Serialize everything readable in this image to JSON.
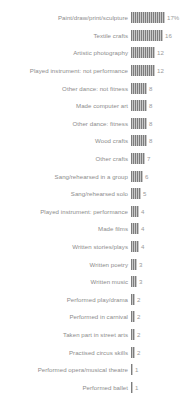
{
  "chart": {
    "title": "",
    "subtitle": "",
    "xlabel": "",
    "ylabel": "",
    "bar_color": "#7d7d7d",
    "bar_fill_color": "#c9c9c9",
    "label_color": "#8c8c8c",
    "value_color": "#9a9a9a",
    "background_color": "#ffffff"
  },
  "chart_data": {
    "type": "bar",
    "orientation": "horizontal",
    "title": "",
    "xlabel": "",
    "ylabel": "",
    "xlim": [
      0,
      17
    ],
    "grid": false,
    "legend": null,
    "units": "percent",
    "categories": [
      "Paint/draw/print/sculpture",
      "Textile crafts",
      "Artistic photography",
      "Played instrument: not performance",
      "Other dance: not fitness",
      "Made computer art",
      "Other dance: fitness",
      "Wood crafts",
      "Other crafts",
      "Sang/rehearsed in a group",
      "Sang/rehearsed solo",
      "Played instrument: performance",
      "Made films",
      "Written stories/plays",
      "Written poetry",
      "Written music",
      "Performed play/drama",
      "Performed in carnival",
      "Taken part in street arts",
      "Practised circus skills",
      "Performed opera/musical theatre",
      "Performed ballet"
    ],
    "values": [
      17,
      16,
      12,
      12,
      8,
      8,
      8,
      8,
      7,
      6,
      5,
      4,
      4,
      4,
      3,
      3,
      2,
      2,
      2,
      2,
      1,
      1
    ],
    "value_labels": [
      "17%",
      "16",
      "12",
      "12",
      "8",
      "8",
      "8",
      "8",
      "7",
      "6",
      "5",
      "4",
      "4",
      "4",
      "3",
      "3",
      "2",
      "2",
      "2",
      "2",
      "1",
      "1"
    ]
  }
}
